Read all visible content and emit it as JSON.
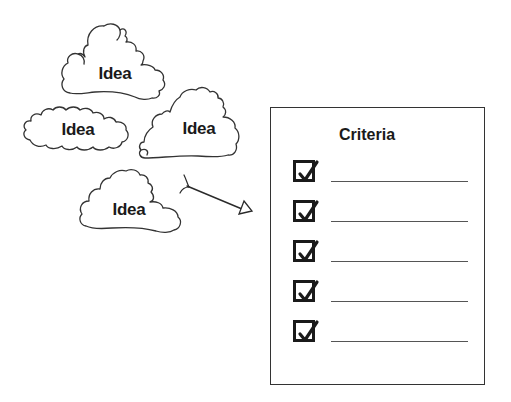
{
  "ideas": [
    {
      "label": "Idea",
      "cx": 115,
      "cy": 74
    },
    {
      "label": "Idea",
      "cx": 78,
      "cy": 130
    },
    {
      "label": "Idea",
      "cx": 199,
      "cy": 129
    },
    {
      "label": "Idea",
      "cx": 129,
      "cy": 210
    }
  ],
  "arrow": {
    "from": [
      188,
      186
    ],
    "to": [
      243,
      209
    ]
  },
  "criteria": {
    "title": "Criteria",
    "items": [
      {
        "checked": true,
        "text": ""
      },
      {
        "checked": true,
        "text": ""
      },
      {
        "checked": true,
        "text": ""
      },
      {
        "checked": true,
        "text": ""
      },
      {
        "checked": true,
        "text": ""
      }
    ]
  },
  "colors": {
    "stroke": "#333333",
    "text": "#1a1a1a",
    "background": "#ffffff"
  }
}
